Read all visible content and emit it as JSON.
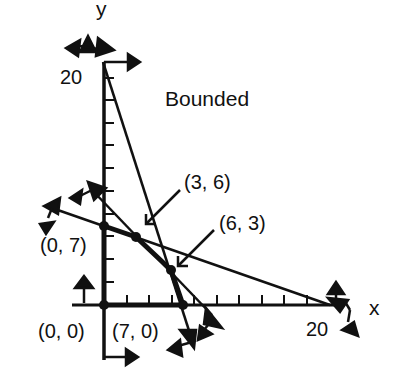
{
  "diagram": {
    "title": "Bounded",
    "axes": {
      "x_label": "x",
      "y_label": "y",
      "x_max_label": "20",
      "y_max_label": "20",
      "x_range": [
        0,
        20
      ],
      "y_range": [
        0,
        20
      ],
      "tick_step": 2
    },
    "vertices": [
      {
        "id": "origin",
        "label": "(0, 0)",
        "x": 0,
        "y": 0
      },
      {
        "id": "y-int",
        "label": "(0, 7)",
        "x": 0,
        "y": 7
      },
      {
        "id": "v36",
        "label": "(3, 6)",
        "x": 3,
        "y": 6
      },
      {
        "id": "v63",
        "label": "(6, 3)",
        "x": 6,
        "y": 3
      },
      {
        "id": "x-int",
        "label": "(7, 0)",
        "x": 7,
        "y": 0
      }
    ],
    "constraints": [
      {
        "name": "steep",
        "p1": [
          0,
          20
        ],
        "p2": [
          7,
          0
        ]
      },
      {
        "name": "middle",
        "p1": [
          0,
          9
        ],
        "p2": [
          9,
          0
        ]
      },
      {
        "name": "shallow",
        "p1": [
          0,
          7
        ],
        "p2": [
          20,
          0
        ]
      }
    ],
    "colors": {
      "ink": "#111111",
      "background": "#ffffff"
    }
  }
}
